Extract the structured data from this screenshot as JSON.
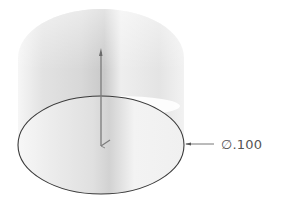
{
  "figure": {
    "cylinder": {
      "center_x": 101,
      "base_center_y": 145,
      "top_center_y": 58,
      "radius_x": 83,
      "radius_y": 49,
      "shade_light": "#f4f4f4",
      "shade_mid": "#d9d9d9",
      "shade_dark": "#c8c8c8"
    },
    "sketch_circle": {
      "stroke": "#3a3a3a"
    },
    "axis": {
      "color": "#777777"
    },
    "dimension": {
      "label": "∅.100",
      "leader_color": "#666666"
    }
  }
}
